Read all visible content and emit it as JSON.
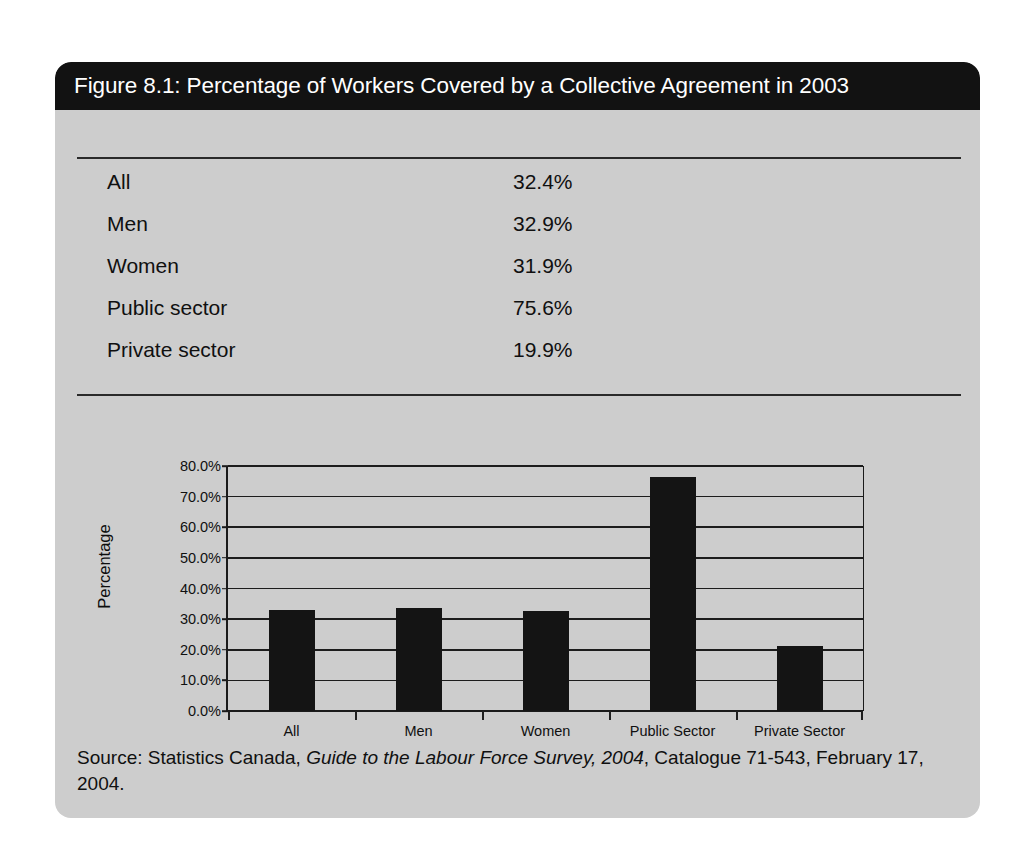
{
  "figure": {
    "title": "Figure 8.1: Percentage of Workers Covered by a Collective Agreement in 2003"
  },
  "summary_table": {
    "rows": [
      {
        "label": "All",
        "value": "32.4%"
      },
      {
        "label": "Men",
        "value": "32.9%"
      },
      {
        "label": "Women",
        "value": "31.9%"
      },
      {
        "label": "Public sector",
        "value": "75.6%"
      },
      {
        "label": "Private sector",
        "value": "19.9%"
      }
    ]
  },
  "source": {
    "prefix": "Source: Statistics Canada, ",
    "italic_title": "Guide to the Labour Force Survey, 2004",
    "suffix": ", Catalogue 71-543, February 17, 2004."
  },
  "colors": {
    "page_background": "#ffffff",
    "card_background": "#cdcdcd",
    "title_bar": "#121212",
    "title_text": "#ffffff",
    "bar_fill": "#141414",
    "axis": "#1a1a1a",
    "body_text": "#101010"
  },
  "chart_data": {
    "type": "bar",
    "title": "",
    "xlabel": "",
    "ylabel": "Percentage",
    "categories": [
      "All",
      "Men",
      "Women",
      "Public Sector",
      "Private Sector"
    ],
    "values": [
      32.9,
      33.6,
      32.7,
      76.4,
      21.2
    ],
    "ylim": [
      0,
      80
    ],
    "ytick_values": [
      0,
      10,
      20,
      30,
      40,
      50,
      60,
      70,
      80
    ],
    "ytick_labels": [
      "0.0%",
      "10.0%",
      "20.0%",
      "30.0%",
      "40.0%",
      "50.0%",
      "60.0%",
      "70.0%",
      "80.0%"
    ],
    "grid": true,
    "grid_axis": "y",
    "legend": false,
    "legend_position": "none",
    "series": [
      {
        "name": "Percentage covered",
        "values": [
          32.9,
          33.6,
          32.7,
          76.4,
          21.2
        ]
      }
    ]
  }
}
